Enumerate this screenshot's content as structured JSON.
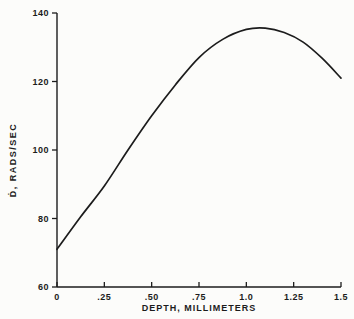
{
  "chart_data": {
    "type": "line",
    "title": "",
    "xlabel": "DEPTH, MILLIMETERS",
    "ylabel": "Ḋ, RADS/SEC",
    "xlim": [
      0,
      1.5
    ],
    "ylim": [
      60,
      140
    ],
    "grid": false,
    "legend": null,
    "line_color": "#1c1c1c",
    "axis_color": "#1c1c1c",
    "background_color": "#fcfcfa",
    "x_ticks": [
      {
        "value": 0,
        "label": "0"
      },
      {
        "value": 0.25,
        "label": ".25"
      },
      {
        "value": 0.5,
        "label": ".50"
      },
      {
        "value": 0.75,
        "label": ".75"
      },
      {
        "value": 1.0,
        "label": "1.0"
      },
      {
        "value": 1.25,
        "label": "1.25"
      },
      {
        "value": 1.5,
        "label": "1.5"
      }
    ],
    "y_ticks": [
      {
        "value": 60,
        "label": "60"
      },
      {
        "value": 80,
        "label": "80"
      },
      {
        "value": 100,
        "label": "100"
      },
      {
        "value": 120,
        "label": "120"
      },
      {
        "value": 140,
        "label": "140"
      }
    ],
    "series": [
      {
        "name": "dose-rate-vs-depth",
        "x": [
          0,
          0.125,
          0.25,
          0.375,
          0.5,
          0.625,
          0.75,
          0.875,
          1.0,
          1.1,
          1.2,
          1.3,
          1.4,
          1.5
        ],
        "y": [
          71,
          80.5,
          89.5,
          100,
          110,
          119,
          127,
          132.3,
          135.2,
          135.6,
          134.3,
          131.5,
          126.8,
          121
        ]
      }
    ]
  }
}
